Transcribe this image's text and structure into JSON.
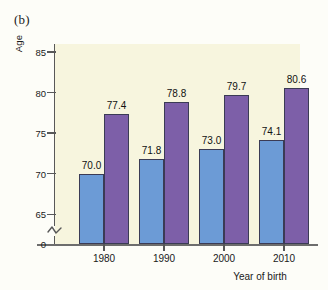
{
  "figure": {
    "panel_letter": "(b)"
  },
  "chart_data": {
    "type": "bar",
    "title": "",
    "subtitle": "",
    "xlabel": "Year of birth",
    "ylabel": "Age",
    "categories": [
      "1980",
      "1990",
      "2000",
      "2010"
    ],
    "series": [
      {
        "name": "male",
        "color": "#6c9bd6",
        "values": [
          70.0,
          71.8,
          73.0,
          74.1
        ]
      },
      {
        "name": "female",
        "color": "#7d5fa8",
        "values": [
          77.4,
          78.8,
          79.7,
          80.6
        ]
      }
    ],
    "value_labels": [
      "70.0",
      "77.4",
      "71.8",
      "78.8",
      "73.0",
      "79.7",
      "74.1",
      "80.6"
    ],
    "ylim": [
      63.3,
      86.0
    ],
    "yticks": [
      85,
      80,
      75,
      70,
      65
    ],
    "ytick_labels": [
      "85",
      "80",
      "75",
      "70",
      "65"
    ],
    "y_origin_label": "0",
    "axis_break": true,
    "grid": false,
    "legend": "none",
    "plot_background": "#f7f5de"
  },
  "colors": {
    "male_bar": "#6c9bd6",
    "female_bar": "#7d5fa8",
    "plot_bg": "#f7f5de",
    "axis": "#585858"
  }
}
